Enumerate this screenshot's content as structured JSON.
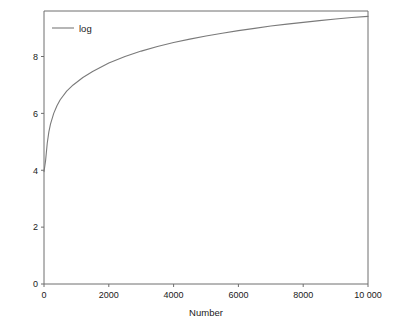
{
  "chart_data": {
    "type": "line",
    "title": "",
    "subtitle": "",
    "xlabel": "Number",
    "ylabel": "",
    "xlim": [
      0,
      10000
    ],
    "ylim": [
      0,
      9.6
    ],
    "grid": false,
    "legend_position": "top-left-inside",
    "line_color": "#7a7a7a",
    "frame_color": "#6e6e6e",
    "background": "#ffffff",
    "xticks": [
      0,
      2000,
      4000,
      6000,
      8000,
      10000
    ],
    "xtick_labels": [
      "0",
      "2000",
      "4000",
      "6000",
      "8000",
      "10 000"
    ],
    "yticks": [
      0,
      2,
      4,
      6,
      8
    ],
    "ytick_labels": [
      "0",
      "2",
      "4",
      "6",
      "8"
    ],
    "series": [
      {
        "name": "log",
        "legend_label": "log",
        "color": "#7a7a7a",
        "x": [
          1,
          25,
          50,
          100,
          150,
          200,
          300,
          400,
          500,
          700,
          900,
          1200,
          1500,
          2000,
          2500,
          3000,
          3500,
          4000,
          4500,
          5000,
          5500,
          6000,
          6500,
          7000,
          7500,
          8000,
          8500,
          9000,
          9500,
          10000
        ],
        "values": [
          3.95,
          4.15,
          4.35,
          4.95,
          5.35,
          5.62,
          6.0,
          6.27,
          6.48,
          6.78,
          7.0,
          7.26,
          7.47,
          7.77,
          8.0,
          8.19,
          8.35,
          8.49,
          8.61,
          8.72,
          8.82,
          8.91,
          8.99,
          9.07,
          9.14,
          9.2,
          9.26,
          9.32,
          9.37,
          9.41
        ]
      }
    ]
  },
  "legend": {
    "entries": [
      {
        "label": "log"
      }
    ]
  },
  "axes": {
    "x_title": "Number",
    "y_title": ""
  }
}
